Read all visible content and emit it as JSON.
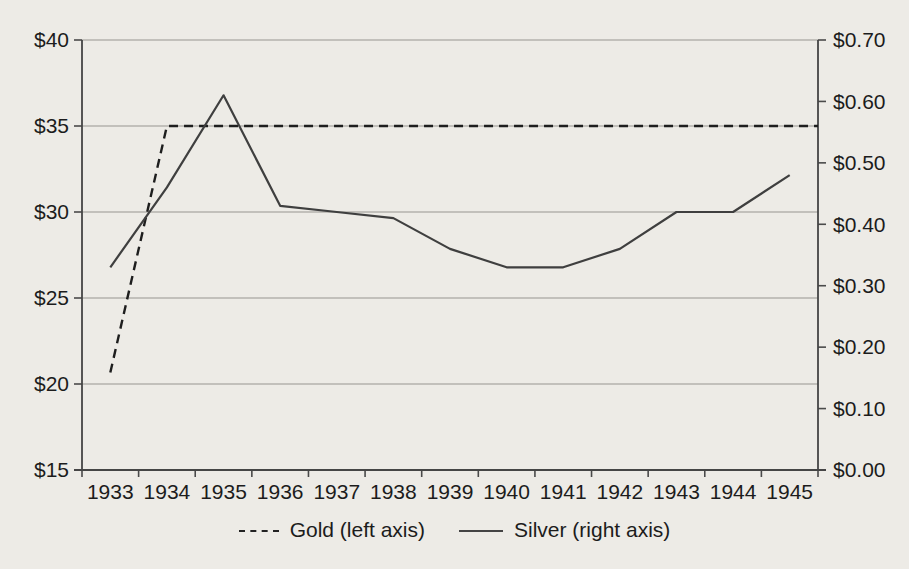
{
  "chart": {
    "background_color": "#edebe6",
    "line_color_gold": "#1e1e1e",
    "line_color_silver": "#3f3f3f",
    "grid_color": "#97958f",
    "text_color": "#1c1c1c"
  },
  "legend": {
    "gold_sample": "dashed-line-sample",
    "silver_sample": "solid-line-sample"
  },
  "chart_data": {
    "type": "line",
    "categories": [
      "1933",
      "1934",
      "1935",
      "1936",
      "1937",
      "1938",
      "1939",
      "1940",
      "1941",
      "1942",
      "1943",
      "1944",
      "1945"
    ],
    "series": [
      {
        "name": "Gold (left axis)",
        "axis": "left",
        "line_style": "dashed",
        "values": [
          20.67,
          35.0,
          35.0,
          35.0,
          35.0,
          35.0,
          35.0,
          35.0,
          35.0,
          35.0,
          35.0,
          35.0,
          35.0
        ]
      },
      {
        "name": "Silver (right axis)",
        "axis": "right",
        "line_style": "solid",
        "values": [
          0.33,
          0.46,
          0.61,
          0.43,
          0.42,
          0.41,
          0.36,
          0.33,
          0.33,
          0.36,
          0.42,
          0.42,
          0.48
        ]
      }
    ],
    "left_axis": {
      "min": 15,
      "max": 40,
      "step": 5,
      "tick_values": [
        40,
        35,
        30,
        25,
        20,
        15
      ],
      "tick_labels": [
        "$40",
        "$35",
        "$30",
        "$25",
        "$20",
        "$15"
      ]
    },
    "right_axis": {
      "min": 0.0,
      "max": 0.7,
      "step": 0.1,
      "tick_values": [
        0.7,
        0.6,
        0.5,
        0.4,
        0.3,
        0.2,
        0.1,
        0.0
      ],
      "tick_labels": [
        "$0.70",
        "$0.60",
        "$0.50",
        "$0.40",
        "$0.30",
        "$0.20",
        "$0.10",
        "$0.00"
      ]
    },
    "grid": "horizontal gridlines at left-axis $5 intervals",
    "legend_position": "bottom",
    "title": ""
  }
}
